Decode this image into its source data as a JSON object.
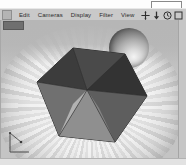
{
  "window": {
    "tooltip_bracket": "",
    "app_icon": "app-icon"
  },
  "menu": {
    "items": [
      {
        "label": "Edit"
      },
      {
        "label": "Cameras"
      },
      {
        "label": "Display"
      },
      {
        "label": "Filter"
      },
      {
        "label": "View"
      }
    ]
  },
  "toolbar": {
    "items": [
      {
        "name": "move-icon",
        "glyph": "move"
      },
      {
        "name": "download-arrow-icon",
        "glyph": "arrow-down"
      },
      {
        "name": "clock-icon",
        "glyph": "clock"
      },
      {
        "name": "stop-square-icon",
        "glyph": "square"
      }
    ]
  },
  "viewport": {
    "label": "",
    "scene": {
      "objects": [
        {
          "name": "polyhedron",
          "type": "icosahedron"
        },
        {
          "name": "sphere",
          "type": "sphere"
        },
        {
          "name": "ground-plane",
          "type": "radial-striped-disc"
        }
      ]
    },
    "gizmo": {
      "name": "axis-gizmo"
    }
  },
  "colors": {
    "menubar": "#c9c9c9",
    "viewport_bg": "#b9b9b9",
    "ground_light": "#efefef",
    "ground_dark": "#cfcfcf",
    "solid_dark": "#3d3d3d",
    "solid_mid": "#6e6e6e",
    "solid_light": "#a8a8a8",
    "frame": "#e2e2e2"
  }
}
